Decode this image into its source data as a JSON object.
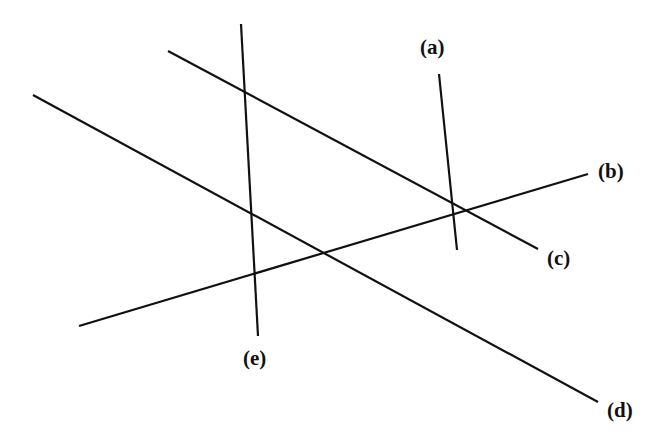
{
  "diagram": {
    "lines": [
      {
        "id": "a",
        "label": "(a)",
        "x1": 439,
        "y1": 74,
        "x2": 457,
        "y2": 250,
        "label_x": 420,
        "label_y": 54
      },
      {
        "id": "b",
        "label": "(b)",
        "x1": 79,
        "y1": 326,
        "x2": 588,
        "y2": 174,
        "label_x": 598,
        "label_y": 178
      },
      {
        "id": "c",
        "label": "(c)",
        "x1": 168,
        "y1": 51,
        "x2": 538,
        "y2": 249,
        "label_x": 547,
        "label_y": 265
      },
      {
        "id": "d",
        "label": "(d)",
        "x1": 33,
        "y1": 95,
        "x2": 598,
        "y2": 402,
        "label_x": 607,
        "label_y": 417
      },
      {
        "id": "e",
        "label": "(e)",
        "x1": 241,
        "y1": 24,
        "x2": 258,
        "y2": 336,
        "label_x": 243,
        "label_y": 365
      }
    ]
  }
}
